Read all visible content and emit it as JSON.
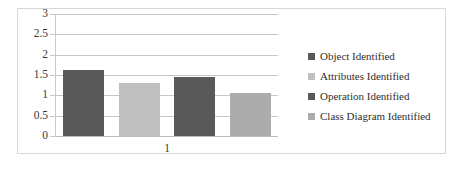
{
  "chart_data": {
    "type": "bar",
    "title": "",
    "xlabel": "",
    "ylabel": "",
    "categories": [
      "1"
    ],
    "ylim": [
      0,
      3
    ],
    "y_ticks": [
      "0",
      "0.5",
      "1",
      "1.5",
      "2",
      "2.5",
      "3"
    ],
    "y_tick_values": [
      0,
      0.5,
      1,
      1.5,
      2,
      2.5,
      3
    ],
    "grid": true,
    "legend_position": "right",
    "series": [
      {
        "name": "Object Identified",
        "values": [
          1.62
        ],
        "color": "#595959"
      },
      {
        "name": "Attributes Identified",
        "values": [
          1.3
        ],
        "color": "#bfbfbf"
      },
      {
        "name": "Operation Identified",
        "values": [
          1.44
        ],
        "color": "#595959"
      },
      {
        "name": "Class Diagram Identified",
        "values": [
          1.05
        ],
        "color": "#acacac"
      }
    ]
  },
  "legend": {
    "items": [
      {
        "label": "Object Identified",
        "swatch": "#595959"
      },
      {
        "label": "Attributes Identified",
        "swatch": "#bfbfbf"
      },
      {
        "label": "Operation Identified",
        "swatch": "#595959"
      },
      {
        "label": "Class Diagram Identified",
        "swatch": "#acacac"
      }
    ]
  },
  "axes": {
    "y": {
      "labels": [
        "3",
        "2.5",
        "2",
        "1.5",
        "1",
        "0.5",
        "0"
      ]
    },
    "x": {
      "labels": [
        "1"
      ]
    }
  },
  "colors": {
    "gridline": "#c6c6c6",
    "axis_line": "#c9c9c9",
    "frame": "#d8d8d8",
    "text": "#3a3a3a",
    "background": "#ffffff"
  }
}
